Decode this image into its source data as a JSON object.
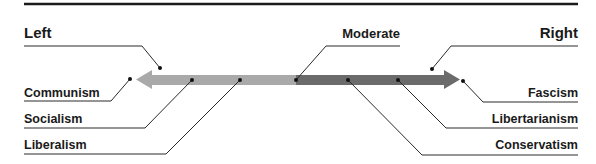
{
  "diagram": {
    "colors": {
      "rule": "#1a1a1a",
      "arrow_left": "#a9a9a9",
      "arrow_right": "#6b6b6b",
      "text": "#1a1a1a",
      "leader": "#2a2a2a"
    },
    "headers": {
      "left": "Left",
      "center": "Moderate",
      "right": "Right"
    },
    "left_items": [
      {
        "label": "Communism"
      },
      {
        "label": "Socialism"
      },
      {
        "label": "Liberalism"
      }
    ],
    "right_items": [
      {
        "label": "Fascism"
      },
      {
        "label": "Libertarianism"
      },
      {
        "label": "Conservatism"
      }
    ]
  }
}
